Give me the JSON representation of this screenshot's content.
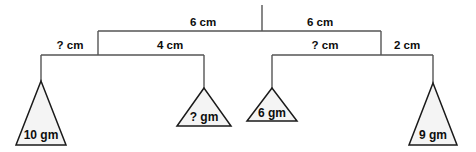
{
  "diagram": {
    "type": "hanging-mobile-balance",
    "title": "",
    "top_support": {
      "name": "ceiling-hanger",
      "x": 262,
      "y_top": 5,
      "y_bottom": 31
    },
    "beams": [
      {
        "id": "top-beam",
        "level": 1,
        "y": 31,
        "left_x": 98,
        "right_x": 381,
        "pivot_x": 262,
        "left_label": "6 cm",
        "right_label": "6 cm",
        "left_label_x": 203,
        "right_label_x": 320,
        "label_y": 23
      },
      {
        "id": "left-beam",
        "level": 2,
        "y": 55,
        "left_x": 41,
        "right_x": 204,
        "pivot_x": 98,
        "left_label": "? cm",
        "right_label": "4 cm",
        "left_label_x": 70,
        "right_label_x": 170,
        "label_y": 46
      },
      {
        "id": "right-beam",
        "level": 2,
        "y": 55,
        "left_x": 272,
        "right_x": 433,
        "pivot_x": 381,
        "left_label": "? cm",
        "right_label": "2 cm",
        "left_label_x": 325,
        "right_label_x": 407,
        "label_y": 46
      }
    ],
    "weights": [
      {
        "id": "weight-10gm",
        "label": "10 gm",
        "apex_x": 41,
        "apex_y": 81,
        "base_y": 145,
        "half_width": 25,
        "drop_from_y": 55,
        "label_y": 136
      },
      {
        "id": "weight-unknown",
        "label": "? gm",
        "apex_x": 204,
        "apex_y": 88,
        "base_y": 126,
        "half_width": 27,
        "drop_from_y": 55,
        "label_y": 118
      },
      {
        "id": "weight-6gm",
        "label": "6 gm",
        "apex_x": 272,
        "apex_y": 88,
        "base_y": 121,
        "half_width": 25,
        "drop_from_y": 55,
        "label_y": 114
      },
      {
        "id": "weight-9gm",
        "label": "9 gm",
        "apex_x": 433,
        "apex_y": 83,
        "base_y": 145,
        "half_width": 24,
        "drop_from_y": 55,
        "label_y": 136
      }
    ],
    "colors": {
      "beam_stroke": "#555555",
      "triangle_stroke": "#1a1a1a",
      "triangle_fill": "#f4f4f4",
      "text": "#0d0d0d",
      "background": "#ffffff"
    }
  }
}
